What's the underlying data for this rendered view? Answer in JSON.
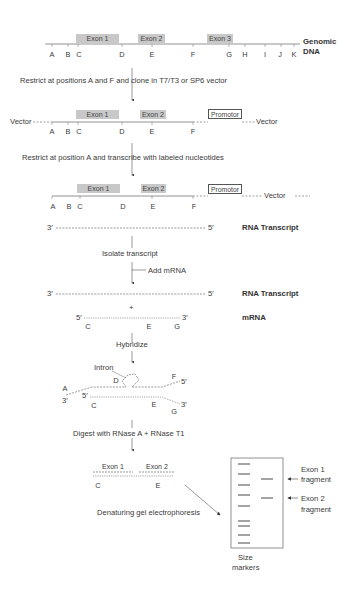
{
  "genomic": {
    "exons": [
      "Exon 1",
      "Exon 2",
      "Exon 3"
    ],
    "positions": [
      "A",
      "B",
      "C",
      "D",
      "E",
      "F",
      "G",
      "H",
      "I",
      "J",
      "K"
    ],
    "label_line1": "Genomic",
    "label_line2": "DNA"
  },
  "steps": {
    "step1": "Restrict at positions A and F and clone in T7/T3 or SP6 vector",
    "step2": "Restrict at position A and transcribe with labeled nucleotides",
    "step3": "Isolate transcript",
    "step3b": "Add mRNA",
    "step4": "Hybridize",
    "step5": "Digest with RNase A + RNase T1",
    "step6": "Denaturing gel electrophoresis"
  },
  "vector": {
    "left": "Vector",
    "right": "Vector",
    "promoter": "Promotor",
    "exons": [
      "Exon 1",
      "Exon 2"
    ],
    "positions": [
      "A",
      "B",
      "C",
      "D",
      "E",
      "F"
    ]
  },
  "transcript": {
    "end3": "3′",
    "end5": "5′",
    "label": "RNA Transcript"
  },
  "mrna": {
    "plus": "+",
    "end5": "5′",
    "end3": "3′",
    "label": "mRNA",
    "positions": [
      "C",
      "E",
      "G"
    ]
  },
  "hybrid": {
    "intron": "Intron",
    "labels": {
      "A": "A",
      "D": "D",
      "F": "F",
      "C": "C",
      "E": "E",
      "G": "G",
      "p3a": "3′",
      "p5a": "5′",
      "p5b": "5′",
      "p3b": "3′"
    }
  },
  "digest": {
    "exons": [
      "Exon 1",
      "Exon 2"
    ],
    "positions": [
      "C",
      "E"
    ]
  },
  "gel": {
    "exon1_line1": "Exon 1",
    "exon1_line2": "fragment",
    "exon2_line1": "Exon 2",
    "exon2_line2": "fragment",
    "markers_line1": "Size",
    "markers_line2": "markers"
  }
}
